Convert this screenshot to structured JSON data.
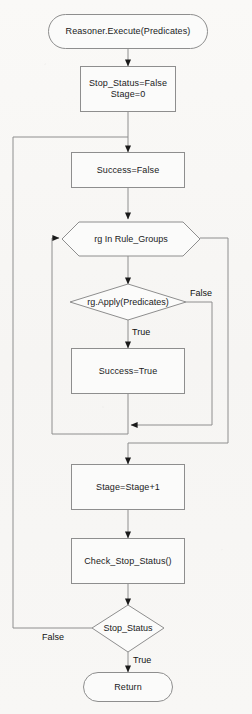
{
  "diagram": {
    "background_color": "#f7f6f4",
    "line_color": "#8e8e8e",
    "text_color": "#1a1a1a"
  },
  "nodes": {
    "start": {
      "label": "Reasoner.Execute(Predicates)",
      "shape": "terminator"
    },
    "init": {
      "label": "Stop_Status=False\nStage=0",
      "shape": "process"
    },
    "success_false": {
      "label": "Success=False",
      "shape": "process"
    },
    "loop_rule_groups": {
      "label": "rg In Rule_Groups",
      "shape": "hexagon"
    },
    "apply_decision": {
      "label": "rg.Apply(Predicates)",
      "shape": "diamond"
    },
    "success_true": {
      "label": "Success=True",
      "shape": "process"
    },
    "stage_increment": {
      "label": "Stage=Stage+1",
      "shape": "process"
    },
    "check_stop_status": {
      "label": "Check_Stop_Status()",
      "shape": "process"
    },
    "stop_status_decision": {
      "label": "Stop_Status",
      "shape": "diamond"
    },
    "return": {
      "label": "Return",
      "shape": "terminator"
    }
  },
  "edge_labels": {
    "apply_false": "False",
    "apply_true": "True",
    "stop_false": "False",
    "stop_true": "True"
  }
}
